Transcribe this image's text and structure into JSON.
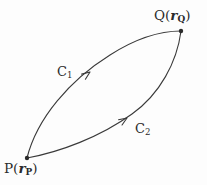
{
  "figure": {
    "name": "two-paths-between-points-diagram",
    "background_color": "#fdfdfd",
    "stroke_color": "#3a3a3a",
    "text_color": "#2b2b2b",
    "width": 207,
    "height": 185
  },
  "points": {
    "start": {
      "name": "P",
      "label_point": "P",
      "label_open_paren": "(",
      "label_vector": "r",
      "label_subscript": "P",
      "label_close_paren": ")",
      "label_full": "P(rP)",
      "x": 27,
      "y": 158
    },
    "end": {
      "name": "Q",
      "label_point": "Q",
      "label_open_paren": "(",
      "label_vector": "r",
      "label_subscript": "Q",
      "label_close_paren": ")",
      "label_full": "Q(rQ)",
      "x": 181,
      "y": 31
    }
  },
  "curves": [
    {
      "id": "C1",
      "label_base": "C",
      "label_subscript": "1",
      "label_full": "C1",
      "description": "upper path from P to Q, bulges up and left",
      "path": "M 27 158 C 37 118, 70 80, 110 55 C 135 39, 160 31, 181 31",
      "arrow_at": {
        "x": 90,
        "y": 72
      },
      "arrow_angle_deg": -36
    },
    {
      "id": "C2",
      "label_base": "C",
      "label_subscript": "2",
      "label_full": "C2",
      "description": "lower path from P to Q, bulges down and right",
      "path": "M 27 158 C 60 152, 100 137, 132 114 C 160 94, 177 62, 181 31",
      "arrow_at": {
        "x": 127,
        "y": 118
      },
      "arrow_angle_deg": -33
    }
  ]
}
